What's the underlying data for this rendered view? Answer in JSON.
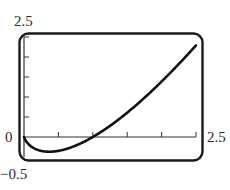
{
  "chart_data": {
    "type": "line",
    "title": "",
    "xlabel": "",
    "ylabel": "",
    "function": "y = x ln x",
    "xlim": [
      0,
      2.5
    ],
    "ylim": [
      -0.5,
      2.5
    ],
    "x_tick_step": 0.5,
    "y_tick_step": 0.5,
    "grid": false,
    "labels": {
      "y_max": "2.5",
      "y_min": "−0.5",
      "x_min": "0",
      "x_max": "2.5"
    },
    "series": [
      {
        "name": "f(x)",
        "x": [
          0.0,
          0.1,
          0.2,
          0.3679,
          0.5,
          0.75,
          1.0,
          1.25,
          1.5,
          1.75,
          2.0,
          2.25,
          2.5
        ],
        "y": [
          0.0,
          -0.23,
          -0.32,
          -0.37,
          -0.35,
          -0.22,
          0.0,
          0.28,
          0.61,
          0.98,
          1.39,
          1.82,
          2.29
        ]
      }
    ],
    "line_color": "#111111"
  }
}
